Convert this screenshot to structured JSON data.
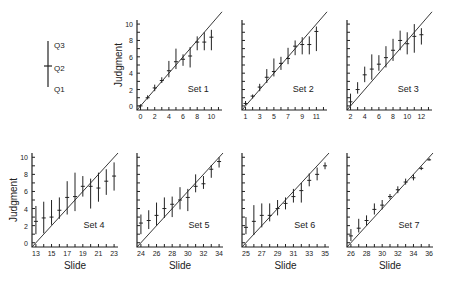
{
  "legend": {
    "labels": [
      "Q3",
      "Q2",
      "Q1"
    ]
  },
  "ylabel": "Judgment",
  "xlabel": "Slide",
  "chart_data": [
    {
      "type": "errorbar",
      "title": "Set 1",
      "xlabel": "",
      "ylabel": "Judgment",
      "xlim": [
        -0.5,
        11.5
      ],
      "ylim": [
        -0.5,
        10.5
      ],
      "xticks": [
        0,
        2,
        4,
        6,
        8,
        10
      ],
      "yticks": [
        0,
        2,
        4,
        6,
        8,
        10
      ],
      "x": [
        0,
        1,
        2,
        3,
        4,
        5,
        6,
        7,
        8,
        9,
        10
      ],
      "q2": [
        0,
        1,
        2.2,
        3.1,
        4.3,
        5.4,
        5.7,
        6.1,
        7.8,
        7.8,
        8.4
      ],
      "q1": [
        -0.2,
        0.8,
        1.8,
        2.8,
        3.5,
        4.5,
        4.9,
        4.7,
        6.8,
        6.8,
        6.8
      ],
      "q3": [
        0.2,
        1.3,
        2.6,
        3.5,
        5.5,
        7.0,
        6.3,
        7.2,
        8.5,
        9.0,
        9.3
      ]
    },
    {
      "type": "errorbar",
      "title": "Set 2",
      "xlabel": "",
      "ylabel": "",
      "xlim": [
        0.5,
        12.5
      ],
      "ylim": [
        -0.5,
        10.5
      ],
      "xticks": [
        1,
        3,
        5,
        7,
        9,
        11
      ],
      "yticks": [
        0,
        2,
        4,
        6,
        8,
        10
      ],
      "x": [
        1,
        2,
        3,
        4,
        5,
        6,
        7,
        8,
        9,
        10,
        11
      ],
      "q2": [
        0.3,
        1.2,
        2.3,
        3.5,
        4.2,
        5.2,
        5.8,
        7.3,
        7.5,
        7.5,
        9.1
      ],
      "q1": [
        0.1,
        0.9,
        1.8,
        2.8,
        3.6,
        4.4,
        5.1,
        6.2,
        6.3,
        6.3,
        6.7
      ],
      "q3": [
        0.6,
        1.4,
        2.7,
        4.5,
        5.8,
        6.0,
        7.1,
        8.0,
        8.4,
        8.5,
        9.7
      ]
    },
    {
      "type": "errorbar",
      "title": "Set 3",
      "xlabel": "",
      "ylabel": "",
      "xlim": [
        1.5,
        13.5
      ],
      "ylim": [
        -0.5,
        10.5
      ],
      "xticks": [
        2,
        4,
        6,
        8,
        10,
        12
      ],
      "yticks": [
        0,
        2,
        4,
        6,
        8,
        10
      ],
      "x": [
        2,
        3,
        4,
        5,
        6,
        7,
        8,
        9,
        10,
        11,
        12
      ],
      "q2": [
        0.5,
        2.0,
        3.8,
        4.5,
        5.1,
        5.9,
        6.8,
        8.0,
        7.6,
        8.5,
        8.7
      ],
      "q1": [
        -0.1,
        1.5,
        2.9,
        3.2,
        4.3,
        4.7,
        5.5,
        6.8,
        6.3,
        6.5,
        7.5
      ],
      "q3": [
        1.5,
        2.9,
        4.8,
        6.3,
        6.2,
        7.3,
        8.2,
        9.2,
        9.0,
        10.0,
        9.5
      ]
    },
    {
      "type": "errorbar",
      "title": "Set 4",
      "xlabel": "Slide",
      "ylabel": "Judgment",
      "xlim": [
        12.5,
        23.5
      ],
      "ylim": [
        -0.5,
        10.5
      ],
      "xticks": [
        13,
        15,
        17,
        19,
        21,
        23
      ],
      "yticks": [
        0,
        2,
        4,
        6,
        8,
        10
      ],
      "x": [
        13,
        14,
        15,
        16,
        17,
        18,
        19,
        20,
        21,
        22,
        23
      ],
      "q2": [
        2.5,
        2.9,
        3.0,
        3.8,
        5.3,
        5.4,
        6.6,
        6.6,
        6.4,
        7.2,
        7.8
      ],
      "q1": [
        1.0,
        1.1,
        2.1,
        2.8,
        3.3,
        3.7,
        5.4,
        4.0,
        4.8,
        5.6,
        6.1
      ],
      "q3": [
        4.3,
        4.8,
        5.0,
        5.3,
        7.2,
        8.2,
        7.8,
        7.5,
        8.2,
        8.6,
        9.4
      ]
    },
    {
      "type": "errorbar",
      "title": "Set 5",
      "xlabel": "Slide",
      "ylabel": "",
      "xlim": [
        23.5,
        34.5
      ],
      "ylim": [
        -0.5,
        10.5
      ],
      "xticks": [
        24,
        26,
        28,
        30,
        32,
        34
      ],
      "yticks": [
        0,
        2,
        4,
        6,
        8,
        10
      ],
      "x": [
        24,
        25,
        26,
        27,
        28,
        29,
        30,
        31,
        32,
        33,
        34
      ],
      "q2": [
        2.3,
        2.6,
        3.2,
        4.0,
        4.5,
        5.0,
        5.3,
        6.6,
        6.9,
        8.6,
        9.5
      ],
      "q1": [
        1.0,
        1.6,
        2.0,
        2.9,
        3.0,
        3.9,
        3.7,
        5.9,
        6.3,
        7.6,
        8.8
      ],
      "q3": [
        3.3,
        3.8,
        4.7,
        5.3,
        5.4,
        6.5,
        6.3,
        8.0,
        7.8,
        9.1,
        10.0
      ]
    },
    {
      "type": "errorbar",
      "title": "Set 6",
      "xlabel": "Slide",
      "ylabel": "",
      "xlim": [
        24.5,
        35.5
      ],
      "ylim": [
        -0.5,
        10.5
      ],
      "xticks": [
        25,
        27,
        29,
        31,
        33,
        35
      ],
      "yticks": [
        0,
        2,
        4,
        6,
        8,
        10
      ],
      "x": [
        25,
        26,
        27,
        28,
        29,
        30,
        31,
        32,
        33,
        34,
        35
      ],
      "q2": [
        1.8,
        2.5,
        3.2,
        3.2,
        4.0,
        4.6,
        5.4,
        6.1,
        7.3,
        8.0,
        9.0
      ],
      "q1": [
        1.0,
        0.9,
        1.8,
        2.5,
        3.2,
        3.9,
        4.7,
        4.7,
        6.6,
        7.3,
        8.6
      ],
      "q3": [
        3.0,
        4.4,
        4.6,
        4.6,
        5.0,
        5.3,
        6.3,
        7.0,
        8.1,
        8.8,
        9.4
      ]
    },
    {
      "type": "errorbar",
      "title": "Set 7",
      "xlabel": "Slide",
      "ylabel": "",
      "xlim": [
        25.5,
        36.5
      ],
      "ylim": [
        -0.5,
        10.5
      ],
      "xticks": [
        26,
        28,
        30,
        32,
        34,
        36
      ],
      "yticks": [
        0,
        2,
        4,
        6,
        8,
        10
      ],
      "x": [
        26,
        27,
        28,
        29,
        30,
        31,
        32,
        33,
        34,
        35,
        36
      ],
      "q2": [
        0.8,
        1.7,
        2.6,
        3.9,
        4.4,
        5.4,
        6.2,
        7.1,
        7.6,
        8.7,
        9.7
      ],
      "q1": [
        0.2,
        1.2,
        2.0,
        3.3,
        3.9,
        5.1,
        5.8,
        6.8,
        7.3,
        8.5,
        9.6
      ],
      "q3": [
        1.6,
        2.8,
        3.2,
        4.6,
        5.0,
        5.7,
        6.6,
        7.5,
        8.0,
        8.9,
        9.9
      ]
    }
  ]
}
